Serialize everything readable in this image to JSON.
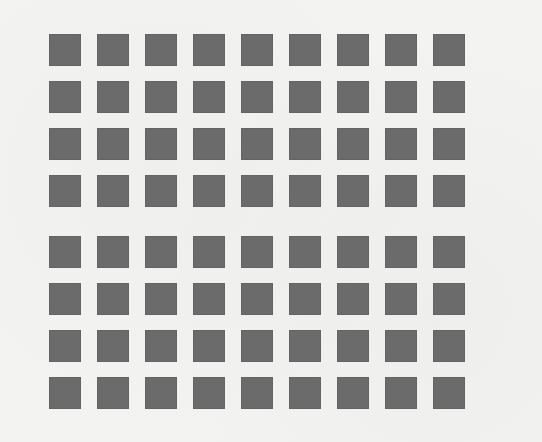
{
  "figure": {
    "background_color": "#f3f3f2",
    "square_color": "#6b6b6b",
    "columns": 9,
    "rows_per_group": 4,
    "groups": [
      {
        "name": "top",
        "rows": 4,
        "columns": 9
      },
      {
        "name": "bottom",
        "rows": 4,
        "columns": 9
      }
    ],
    "square_size_px": 32,
    "total_squares": 72
  },
  "bleedthrough_text": ""
}
